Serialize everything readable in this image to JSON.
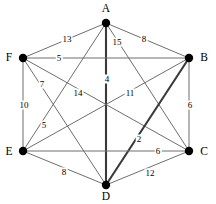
{
  "figure": {
    "name": "weighted-undirected-graph",
    "background": "#ffffff",
    "edge_color": "#6e6e6e",
    "highlight_color": "#3a3a3a",
    "vertex_color": "#000000",
    "width": 216,
    "height": 204
  },
  "chart_data": {
    "type": "diagram",
    "title": "",
    "xlabel": "",
    "ylabel": "",
    "layout": "hexagonal",
    "directed": false,
    "nodes": [
      {
        "id": "A",
        "label": "A",
        "x": 106,
        "y": 23,
        "label_x": 106,
        "label_y": 9
      },
      {
        "id": "B",
        "label": "B",
        "x": 189,
        "y": 58,
        "label_x": 204,
        "label_y": 58
      },
      {
        "id": "C",
        "label": "C",
        "x": 189,
        "y": 151,
        "label_x": 204,
        "label_y": 152
      },
      {
        "id": "D",
        "label": "D",
        "x": 106,
        "y": 185,
        "label_x": 106,
        "label_y": 197
      },
      {
        "id": "E",
        "label": "E",
        "x": 23,
        "y": 151,
        "label_x": 9,
        "label_y": 152
      },
      {
        "id": "F",
        "label": "F",
        "x": 23,
        "y": 58,
        "label_x": 9,
        "label_y": 58
      }
    ],
    "edges": [
      {
        "source": "A",
        "target": "F",
        "weight": 13,
        "label": "13",
        "label_x": 67,
        "label_y": 39,
        "bold": false
      },
      {
        "source": "A",
        "target": "B",
        "weight": 8,
        "label": "8",
        "label_x": 144,
        "label_y": 39,
        "bold": false
      },
      {
        "source": "A",
        "target": "C",
        "weight": 15,
        "label": "15",
        "label_x": 117,
        "label_y": 42,
        "bold": false
      },
      {
        "source": "A",
        "target": "D",
        "weight": 4,
        "label": "4",
        "label_x": 107,
        "label_y": 79,
        "bold": true
      },
      {
        "source": "A",
        "target": "E",
        "weight": 5,
        "label": "5",
        "label_x": 44,
        "label_y": 125,
        "bold": false
      },
      {
        "source": "F",
        "target": "B",
        "weight": 5,
        "label": "5",
        "label_x": 59,
        "label_y": 58,
        "bold": false
      },
      {
        "source": "F",
        "target": "D",
        "weight": 7,
        "label": "7",
        "label_x": 42,
        "label_y": 84,
        "bold": false
      },
      {
        "source": "F",
        "target": "E",
        "weight": 10,
        "label": "10",
        "label_x": 24,
        "label_y": 105,
        "bold": false
      },
      {
        "source": "F",
        "target": "C",
        "weight": 14,
        "label": "14",
        "label_x": 78,
        "label_y": 93,
        "bold": false
      },
      {
        "source": "B",
        "target": "E",
        "weight": 11,
        "label": "11",
        "label_x": 130,
        "label_y": 93,
        "bold": false
      },
      {
        "source": "B",
        "target": "C",
        "weight": 6,
        "label": "6",
        "label_x": 190,
        "label_y": 105,
        "bold": false
      },
      {
        "source": "B",
        "target": "D",
        "weight": 2,
        "label": "2",
        "label_x": 139,
        "label_y": 139,
        "bold": true
      },
      {
        "source": "E",
        "target": "C",
        "weight": 6,
        "label": "6",
        "label_x": 158,
        "label_y": 151,
        "bold": false
      },
      {
        "source": "E",
        "target": "D",
        "weight": 8,
        "label": "8",
        "label_x": 64,
        "label_y": 172,
        "bold": false
      },
      {
        "source": "D",
        "target": "C",
        "weight": 12,
        "label": "12",
        "label_x": 150,
        "label_y": 173,
        "bold": false
      }
    ]
  }
}
